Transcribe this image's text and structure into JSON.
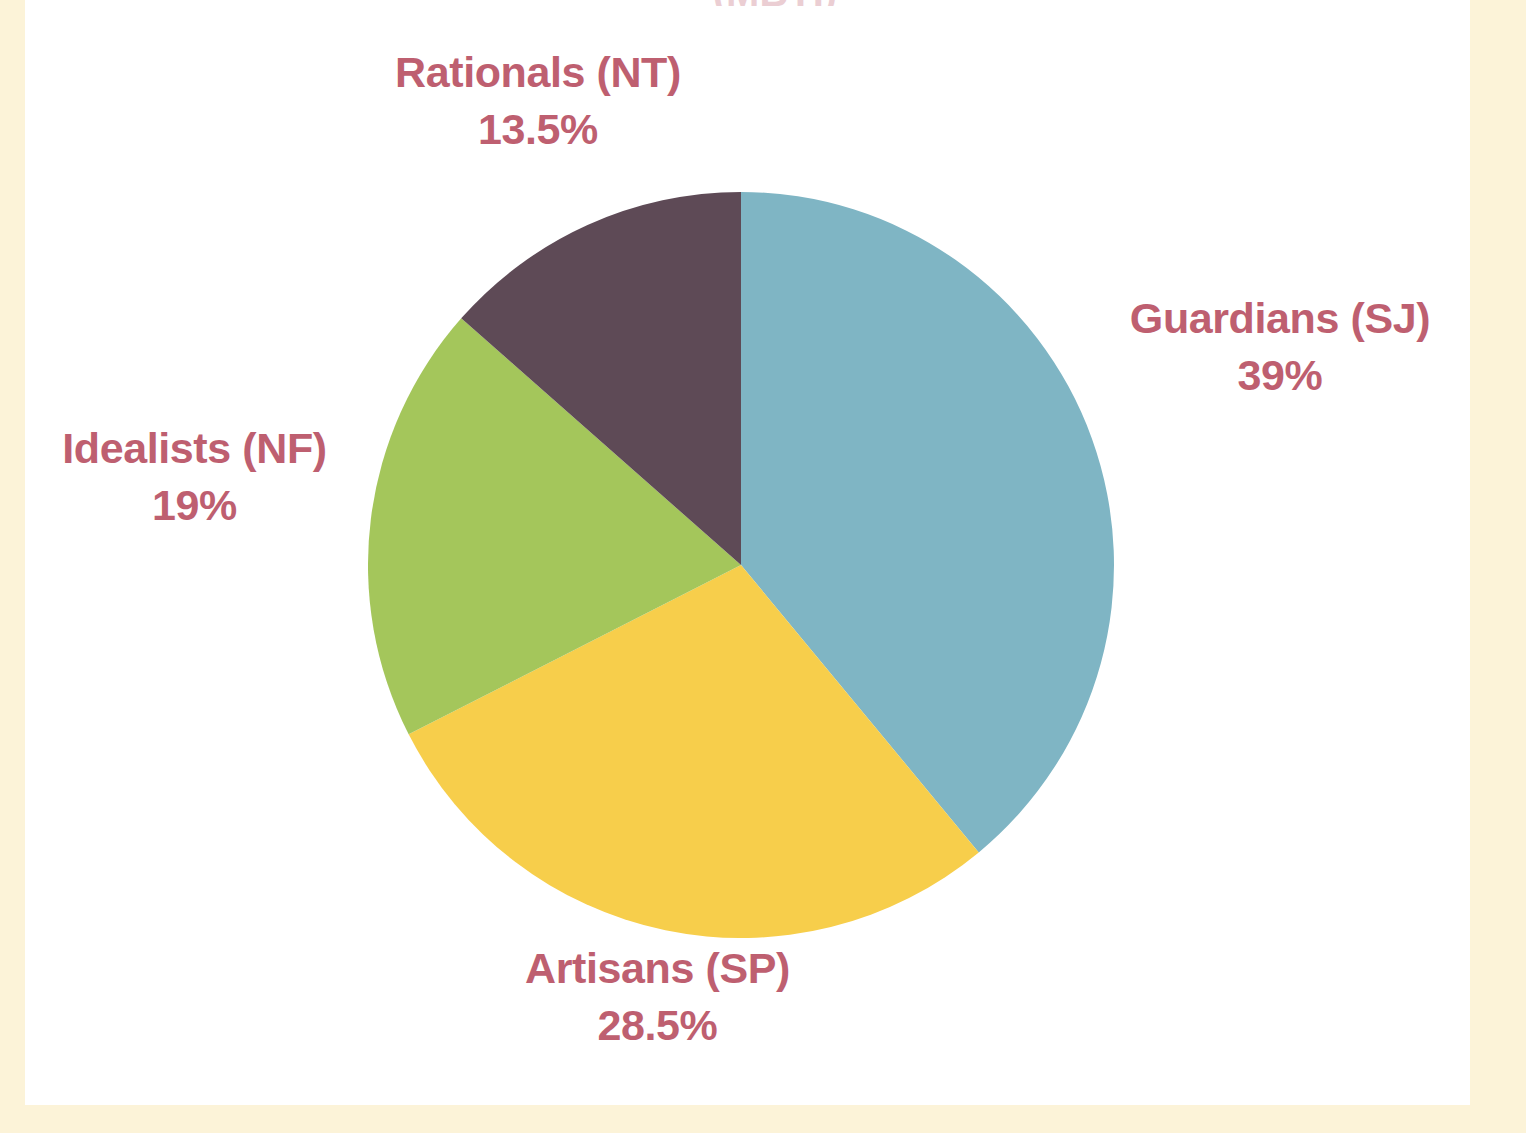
{
  "figure": {
    "clipped_title": "(MBTI)",
    "background_color": "#ffffff",
    "margin_color": "#fcf3d8",
    "label_color": "#be5f70"
  },
  "labels": {
    "rationals": {
      "name": "Rationals (NT)",
      "value": "13.5%"
    },
    "guardians": {
      "name": "Guardians (SJ)",
      "value": "39%"
    },
    "idealists": {
      "name": "Idealists (NF)",
      "value": "19%"
    },
    "artisans": {
      "name": "Artisans (SP)",
      "value": "28.5%"
    }
  },
  "chart_data": {
    "type": "pie",
    "title": "",
    "xlabel": "",
    "ylabel": "",
    "legend_position": "none",
    "grid": false,
    "start_angle_deg": 0,
    "direction": "clockwise",
    "center": [
      741,
      565
    ],
    "radius": 373,
    "labels": [
      "Guardians (SJ)",
      "Artisans (SP)",
      "Idealists (NF)",
      "Rationals (NT)"
    ],
    "values": [
      39,
      28.5,
      19,
      13.5
    ],
    "value_labels": [
      "39%",
      "28.5%",
      "19%",
      "13.5%"
    ],
    "colors": [
      "#7fb5c4",
      "#f7ce4b",
      "#a4c65b",
      "#5e4a56"
    ],
    "slices": [
      {
        "label": "Guardians (SJ)",
        "value": 39,
        "value_label": "39%",
        "color": "#7fb5c4",
        "start_deg": 0,
        "end_deg": 140.4
      },
      {
        "label": "Artisans (SP)",
        "value": 28.5,
        "value_label": "28.5%",
        "color": "#f7ce4b",
        "start_deg": 140.4,
        "end_deg": 243.0
      },
      {
        "label": "Idealists (NF)",
        "value": 19,
        "value_label": "19%",
        "color": "#a4c65b",
        "start_deg": 243.0,
        "end_deg": 311.4
      },
      {
        "label": "Rationals (NT)",
        "value": 13.5,
        "value_label": "13.5%",
        "color": "#5e4a56",
        "start_deg": 311.4,
        "end_deg": 360.0
      }
    ],
    "total": 100,
    "units": "percent"
  }
}
